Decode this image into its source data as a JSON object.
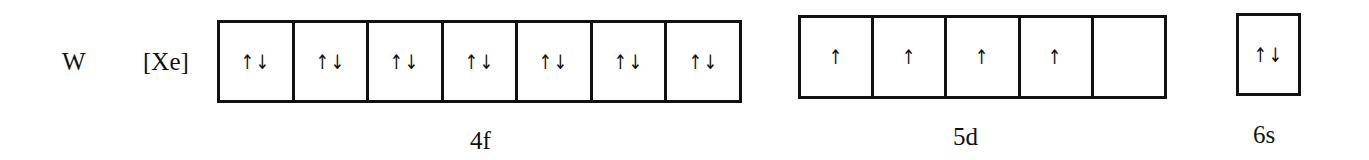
{
  "element": {
    "symbol": "W",
    "core": "[Xe]"
  },
  "subshells": [
    {
      "label": "4f",
      "orbitals": [
        "↑↓",
        "↑↓",
        "↑↓",
        "↑↓",
        "↑↓",
        "↑↓",
        "↑↓"
      ]
    },
    {
      "label": "5d",
      "orbitals": [
        "↑",
        "↑",
        "↑",
        "↑",
        ""
      ]
    },
    {
      "label": "6s",
      "orbitals": [
        "↑↓"
      ]
    }
  ],
  "colors": {
    "line": "#111111",
    "background": "#ffffff"
  }
}
